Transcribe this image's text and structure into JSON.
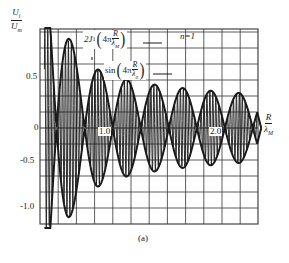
{
  "chart_data": {
    "type": "line",
    "title": "",
    "panel_label": "(a)",
    "annotation": "n=1",
    "ylabel": {
      "num": "U",
      "num_sub": "i",
      "den": "U",
      "den_sub": "m"
    },
    "xlabel": {
      "num": "R",
      "den": "λ",
      "den_sub": "M"
    },
    "y_ticks": [
      {
        "value": 0.5,
        "label": "0.5"
      },
      {
        "value": 0,
        "label": "0"
      },
      {
        "value": -0.5,
        "label": "-0.5"
      },
      {
        "value": -1.0,
        "label": "-1.0"
      }
    ],
    "x_ticks": [
      {
        "value": 1.0,
        "label": "1.0"
      },
      {
        "value": 2.0,
        "label": "2.0"
      }
    ],
    "xlim": [
      0.45,
      2.4
    ],
    "ylim": [
      -1.15,
      1.05
    ],
    "grid": true,
    "series": [
      {
        "name": "2J1(4πR/λM)",
        "label_text": "2J₁(4π R/λM)",
        "style": "envelope (thick)",
        "description": "Bessel envelope: ±|2J1| lobes, decaying amplitude",
        "envelope_peaks": [
          {
            "x": 0.52,
            "y": 0.9
          },
          {
            "x": 0.52,
            "y": -1.0
          },
          {
            "x": 0.72,
            "y": 0.55
          },
          {
            "x": 0.85,
            "y": 0.4
          },
          {
            "x": 1.1,
            "y": 0.4
          },
          {
            "x": 1.35,
            "y": 0.35
          },
          {
            "x": 1.6,
            "y": 0.33
          },
          {
            "x": 1.85,
            "y": 0.3
          },
          {
            "x": 2.1,
            "y": 0.3
          },
          {
            "x": 2.32,
            "y": 0.28
          }
        ]
      },
      {
        "name": "sin(4πR/λ0)",
        "label_text": "sin(4π R/λ0)",
        "style": "carrier (dense vertical oscillation)",
        "description": "Fast oscillation filling the Bessel envelope"
      }
    ],
    "legend": [
      {
        "text_prefix": "2J",
        "sub": "1",
        "arg": "4π",
        "frac_num": "R",
        "frac_den": "λ",
        "frac_den_sub": "M"
      },
      {
        "text_prefix": "sin",
        "sub": "",
        "arg": "4π",
        "frac_num": "R",
        "frac_den": "λ",
        "frac_den_sub": "0"
      }
    ]
  },
  "colors": {
    "ink": "#1a1a1a",
    "grid": "#333333",
    "background": "#ffffff"
  }
}
